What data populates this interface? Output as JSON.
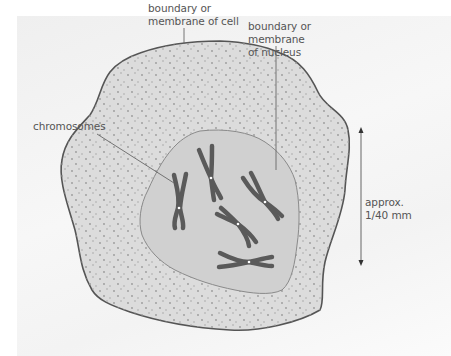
{
  "diagram": {
    "labels": {
      "cell_membrane": "boundary or\nmembrane of cell",
      "nucleus_membrane": "boundary or\nmembrane\nof nucleus",
      "chromosomes": "chromosomes",
      "scale": "approx.\n1/40 mm"
    },
    "colors": {
      "background_panel": "#f2f2f2",
      "cell_fill": "#dcdcdc",
      "cell_stroke": "#555555",
      "nucleus_fill": "#cfcfcf",
      "nucleus_stroke": "#8a8a8a",
      "chromosome": "#5a5a5a",
      "leader_line": "#666666",
      "text": "#555555"
    },
    "scale_arrow": {
      "x": 361,
      "y_top": 128,
      "y_bottom": 265
    },
    "chromosome_count": 6
  }
}
